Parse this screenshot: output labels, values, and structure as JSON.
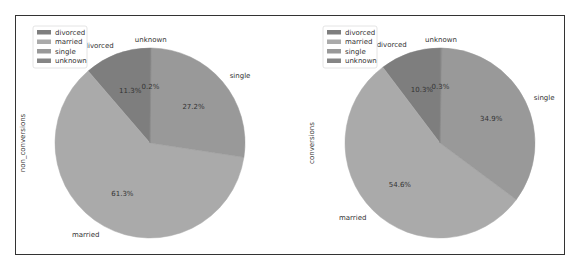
{
  "chart_data": [
    {
      "type": "pie",
      "ylabel": "non_conversions",
      "categories": [
        "divorced",
        "married",
        "single",
        "unknown"
      ],
      "values": [
        11.3,
        61.3,
        27.2,
        0.2
      ],
      "value_labels": [
        "11.3%",
        "61.3%",
        "27.2%",
        "0.2%"
      ],
      "colors": [
        "#7e7e7e",
        "#aaaaaa",
        "#999999",
        "#858585"
      ],
      "legend": [
        "divorced",
        "married",
        "single",
        "unknown"
      ],
      "legend_position": "upper left",
      "startangle": 90
    },
    {
      "type": "pie",
      "ylabel": "conversions",
      "categories": [
        "divorced",
        "married",
        "single",
        "unknown"
      ],
      "values": [
        10.3,
        54.6,
        34.9,
        0.3
      ],
      "value_labels": [
        "10.3%",
        "54.6%",
        "34.9%",
        "0.3%"
      ],
      "colors": [
        "#7e7e7e",
        "#aaaaaa",
        "#999999",
        "#858585"
      ],
      "legend": [
        "divorced",
        "married",
        "single",
        "unknown"
      ],
      "legend_position": "upper left",
      "startangle": 90
    }
  ]
}
